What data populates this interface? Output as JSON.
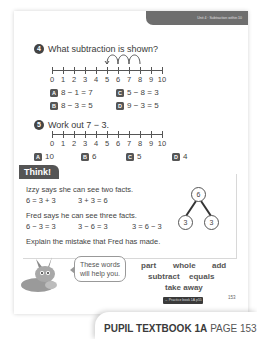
{
  "header": {
    "unit_tab": "Unit 4 · Subtraction within 10"
  },
  "question4": {
    "number": "4",
    "prompt": "What subtraction is shown?",
    "numberline": {
      "labels": [
        "0",
        "1",
        "2",
        "3",
        "4",
        "5",
        "6",
        "7",
        "8",
        "9",
        "10"
      ],
      "jumps": "3 backward jumps from 8 to 5"
    },
    "options": [
      {
        "letter": "A",
        "text": "8 − 1 = 7"
      },
      {
        "letter": "B",
        "text": "8 − 3 = 5"
      },
      {
        "letter": "C",
        "text": "5 − 8 = 3"
      },
      {
        "letter": "D",
        "text": "9 − 3 = 5"
      }
    ]
  },
  "question5": {
    "number": "5",
    "prompt": "Work out 7 − 3.",
    "numberline": {
      "labels": [
        "0",
        "1",
        "2",
        "3",
        "4",
        "5",
        "6",
        "7",
        "8",
        "9",
        "10"
      ]
    },
    "options": [
      {
        "letter": "A",
        "text": "10"
      },
      {
        "letter": "B",
        "text": "6"
      },
      {
        "letter": "C",
        "text": "5"
      },
      {
        "letter": "D",
        "text": "4"
      }
    ]
  },
  "think": {
    "title": "Think!",
    "izzy_line": "Izzy says she can see two facts.",
    "izzy_facts": [
      "6 = 3 + 3",
      "3 + 3 = 6"
    ],
    "fred_line": "Fred says he can see three facts.",
    "fred_facts": [
      "6 − 3 = 3",
      "3 − 6 = 3",
      "3 = 6 − 3"
    ],
    "prompt": "Explain the mistake that Fred has made.",
    "part_whole": {
      "whole": "6",
      "part_left": "3",
      "part_right": "3"
    }
  },
  "helper": {
    "bubble_text_line1": "These words",
    "bubble_text_line2": "will help you.",
    "words_row1": [
      "part",
      "whole",
      "add"
    ],
    "words_row2": [
      "subtract",
      "equals"
    ],
    "words_row3": [
      "take away"
    ]
  },
  "page_footer": {
    "practice_tag": "→ Practice book 1A p55",
    "page_number": "153"
  },
  "footer_tab": {
    "bold": "PUPIL TEXTBOOK 1A",
    "light": "PAGE 153"
  }
}
